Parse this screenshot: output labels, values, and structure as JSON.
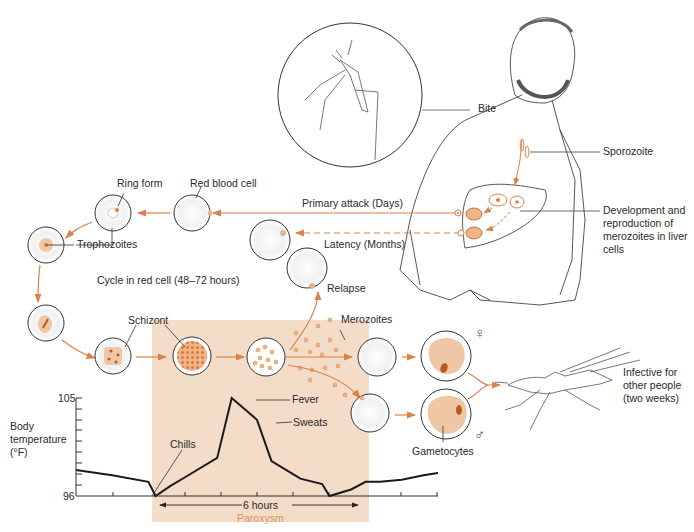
{
  "diagram": {
    "colors": {
      "accent_orange": "#d9824a",
      "paroxysm_box": "#f3dcc8",
      "parasite_fill": "#f0c7a5",
      "parasite_dark": "#b85a25",
      "line": "#333333",
      "text": "#2a2a2a"
    },
    "labels": {
      "bite": "Bite",
      "sporozoite": "Sporozoite",
      "liver_development": "Development and reproduction of merozoites in liver cells",
      "primary_attack": "Primary attack (Days)",
      "latency": "Latency (Months)",
      "relapse": "Relapse",
      "red_blood_cell": "Red blood cell",
      "ring_form": "Ring form",
      "trophozoites": "Trophozoites",
      "cycle_in_red_cell": "Cycle in red cell (48–72 hours)",
      "schizont": "Schizont",
      "merozoites": "Merozoites",
      "gametocytes": "Gametocytes",
      "female_symbol": "♀",
      "male_symbol": "♂",
      "infective": "Infective for other people (two weeks)"
    },
    "icons": [
      "mosquito-biting-icon",
      "human-figure-icon",
      "liver-icon",
      "red-blood-cell-icon",
      "mosquito-icon",
      "female-symbol-icon",
      "male-symbol-icon"
    ]
  },
  "chart_data": {
    "type": "line",
    "title": "",
    "ylabel": "Body temperature (°F)",
    "xlabel": "",
    "ylim": [
      96,
      105
    ],
    "y_tick_labels": [
      "105",
      "96"
    ],
    "x": [
      0,
      1,
      2,
      2.2,
      2.6,
      3,
      3.9,
      4.3,
      5,
      5.4,
      5.7,
      6.2,
      6.8,
      7,
      7.6,
      8,
      8.4,
      9,
      9.6,
      10
    ],
    "values": [
      98.4,
      97.9,
      97.3,
      96.0,
      96.9,
      97.7,
      99.5,
      105.0,
      103.0,
      99.2,
      98.6,
      97.6,
      97.1,
      96.0,
      96.6,
      97.3,
      97.3,
      97.5,
      97.9,
      98.1
    ],
    "annotations": {
      "chills": "Chills",
      "fever": "Fever",
      "sweats": "Sweats",
      "duration": "6 hours",
      "phase": "Paroxysm"
    },
    "highlight_region": {
      "label": "Paroxysm",
      "span": "6 hours"
    },
    "grid": false
  }
}
